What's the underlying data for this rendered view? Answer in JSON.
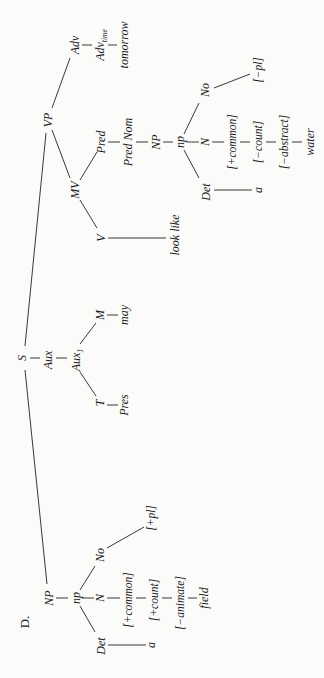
{
  "diagram": {
    "label": "D.",
    "type": "phrase-structure tree (rotated 90° counter-clockwise)",
    "nodes": {
      "S": "S",
      "NP": "NP",
      "np_subj": "np",
      "Det_subj": "Det",
      "a_subj": "a",
      "N_subj": "N",
      "No_subj": "No",
      "plus_pl": "[+pl]",
      "plus_common_subj": "[+common]",
      "plus_count": "[+count]",
      "minus_animate": "[−animate]",
      "field": "field",
      "Aux": "Aux",
      "Aux1": "Aux",
      "Aux1_sub": "1",
      "T": "T",
      "Pres": "Pres",
      "M": "M",
      "may": "may",
      "VP": "VP",
      "MV": "MV",
      "V": "V",
      "look_like": "look like",
      "Pred": "Pred",
      "PredNom": "Pred Nom",
      "NP_pred": "NP",
      "np_pred": "np",
      "Det_pred": "Det",
      "a_pred": "a",
      "N_pred": "N",
      "No_pred": "No",
      "minus_pl": "[−pl]",
      "plus_common_pred": "[+common]",
      "minus_count": "[−count]",
      "minus_abstract": "[−abstract]",
      "water": "water",
      "Adv": "Adv",
      "Adv_time": "Adv",
      "Adv_time_sub": "time",
      "tomorrow": "tomorrow"
    },
    "edges": [
      [
        "S",
        "NP"
      ],
      [
        "S",
        "Aux"
      ],
      [
        "S",
        "VP"
      ],
      [
        "NP",
        "np_subj"
      ],
      [
        "np_subj",
        "Det_subj"
      ],
      [
        "np_subj",
        "N_subj"
      ],
      [
        "np_subj",
        "No_subj"
      ],
      [
        "Det_subj",
        "a_subj"
      ],
      [
        "No_subj",
        "plus_pl"
      ],
      [
        "N_subj",
        "plus_common_subj"
      ],
      [
        "plus_common_subj",
        "plus_count"
      ],
      [
        "plus_count",
        "minus_animate"
      ],
      [
        "minus_animate",
        "field"
      ],
      [
        "Aux",
        "Aux1"
      ],
      [
        "Aux1",
        "T"
      ],
      [
        "Aux1",
        "M"
      ],
      [
        "T",
        "Pres"
      ],
      [
        "M",
        "may"
      ],
      [
        "VP",
        "MV"
      ],
      [
        "VP",
        "Adv"
      ],
      [
        "MV",
        "V"
      ],
      [
        "MV",
        "Pred"
      ],
      [
        "V",
        "look_like"
      ],
      [
        "Pred",
        "PredNom"
      ],
      [
        "PredNom",
        "NP_pred"
      ],
      [
        "NP_pred",
        "np_pred"
      ],
      [
        "np_pred",
        "Det_pred"
      ],
      [
        "np_pred",
        "N_pred"
      ],
      [
        "np_pred",
        "No_pred"
      ],
      [
        "Det_pred",
        "a_pred"
      ],
      [
        "No_pred",
        "minus_pl"
      ],
      [
        "N_pred",
        "plus_common_pred"
      ],
      [
        "plus_common_pred",
        "minus_count"
      ],
      [
        "minus_count",
        "minus_abstract"
      ],
      [
        "minus_abstract",
        "water"
      ],
      [
        "Adv",
        "Adv_time"
      ],
      [
        "Adv_time",
        "tomorrow"
      ]
    ],
    "sentence": "a field may look like a water tomorrow"
  }
}
